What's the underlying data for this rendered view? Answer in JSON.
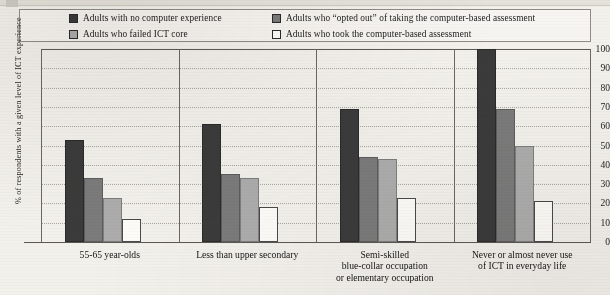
{
  "chart_data": {
    "type": "bar",
    "title": "",
    "xlabel": "",
    "ylabel": "% of respondents with a given level of ICT experience",
    "ylim": [
      0,
      100
    ],
    "ytick_step": 10,
    "yticks": [
      "100",
      "90",
      "80",
      "70",
      "60",
      "50",
      "40",
      "30",
      "20",
      "10",
      "0"
    ],
    "grid": "horizontal-dotted",
    "legend_position": "top",
    "categories": [
      "55-65 year-olds",
      "Less than upper secondary",
      "Semi-skilled\nblue-collar occupation\nor elementary occupation",
      "Never or almost never use\nof ICT in everyday life"
    ],
    "category_lines": [
      [
        "55-65 year-olds"
      ],
      [
        "Less than upper secondary"
      ],
      [
        "Semi-skilled",
        "blue-collar occupation",
        "or elementary occupation"
      ],
      [
        "Never or almost never use",
        "of ICT in everyday life"
      ]
    ],
    "series": [
      {
        "name": "Adults with no computer experience",
        "color": "#3b3b3b",
        "values": [
          53,
          61,
          69,
          100
        ]
      },
      {
        "name": "Adults who “opted out” of taking the computer-based assessment",
        "color": "#7b7b7b",
        "values": [
          33,
          35,
          44,
          69
        ]
      },
      {
        "name": "Adults who failed ICT core",
        "color": "#adadad",
        "values": [
          23,
          33,
          43,
          50
        ]
      },
      {
        "name": "Adults who took the computer-based assessment",
        "color": "#fdfcf9",
        "values": [
          12,
          18,
          23,
          21
        ]
      }
    ]
  },
  "legend": {
    "row1": [
      {
        "label": "Adults with no computer experience",
        "color": "#3b3b3b"
      },
      {
        "label": "Adults who “opted out” of taking the computer-based assessment",
        "color": "#7b7b7b"
      }
    ],
    "row2": [
      {
        "label": "Adults who failed ICT core",
        "color": "#adadad"
      },
      {
        "label": "Adults who took the computer-based assessment",
        "color": "#fdfcf9"
      }
    ]
  }
}
